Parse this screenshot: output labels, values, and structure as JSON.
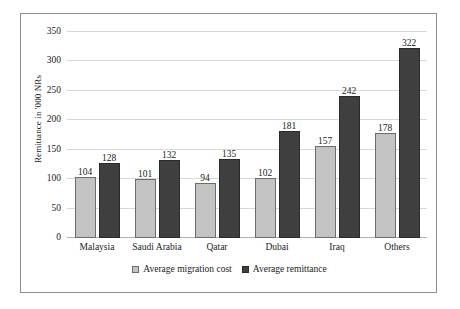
{
  "chart_data": {
    "type": "bar",
    "title": "",
    "xlabel": "",
    "ylabel": "Remittance in '000 NRs",
    "categories": [
      "Malaysia",
      "Saudi Arabia",
      "Qatar",
      "Dubai",
      "Iraq",
      "Others"
    ],
    "series": [
      {
        "name": "Average migration cost",
        "color": "#c3c3c3",
        "values": [
          104,
          101,
          94,
          102,
          157,
          178
        ]
      },
      {
        "name": "Average remittance",
        "color": "#3f3f3f",
        "values": [
          128,
          132,
          135,
          181,
          242,
          322
        ]
      }
    ],
    "ylim": [
      0,
      350
    ],
    "yticks": [
      0,
      50,
      100,
      150,
      200,
      250,
      300,
      350
    ],
    "ytick_labels": [
      "0",
      "50",
      "100",
      "150",
      "200",
      "250",
      "300",
      "350"
    ],
    "grid": true,
    "legend_position": "bottom",
    "data_labels": true
  }
}
